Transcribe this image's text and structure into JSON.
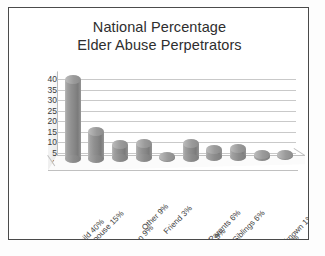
{
  "chart_data": {
    "type": "bar",
    "title": "National Percentage Elder Abuse Perpetrators",
    "title_lines": [
      "National Percentage",
      "Elder Abuse Perpetrators"
    ],
    "xlabel": "",
    "ylabel": "",
    "ylim": [
      0,
      40
    ],
    "ytick_step": 5,
    "grid": true,
    "legend": "none",
    "style_3d": true,
    "bar_color": "#8d8d8d",
    "gridline_color": "#c9c9c9",
    "categories": [
      "Adult Child 40%",
      "Spouse 15%",
      "Grandchildren 9%",
      "Other 9%",
      "Friend 3%",
      "Other Relatives 9%",
      "Parents 6%",
      "Siblings 6%",
      "Service Providers 3%",
      "Unknown 1%"
    ],
    "values": [
      40,
      15,
      9,
      9,
      3,
      9,
      6,
      6,
      3,
      1
    ],
    "yticks": [
      "40",
      "35",
      "30",
      "25",
      "20",
      "15",
      "10",
      "5",
      "0"
    ]
  }
}
